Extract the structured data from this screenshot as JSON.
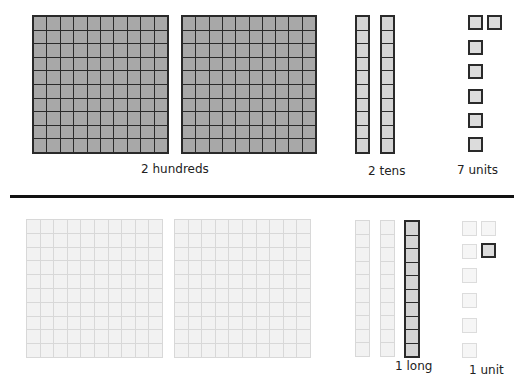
{
  "top": {
    "hundreds": {
      "count": 2,
      "label": "2 hundreds"
    },
    "tens": {
      "count": 2,
      "label": "2 tens"
    },
    "units": {
      "count": 7,
      "label": "7 units"
    }
  },
  "bottom": {
    "hundreds": {
      "count": 2,
      "state": "faded"
    },
    "tens": {
      "faded_count": 2,
      "highlighted_count": 1,
      "label": "1 long"
    },
    "units": {
      "faded_count": 6,
      "highlighted_count": 1,
      "label": "1 unit"
    }
  },
  "colors": {
    "block_fill": "#a8a8a8",
    "rod_fill": "#d4d4d4",
    "outline": "#2a2a2a",
    "faded_fill": "#f2f2f2",
    "faded_outline": "#d8d8d8",
    "divider": "#111111"
  }
}
